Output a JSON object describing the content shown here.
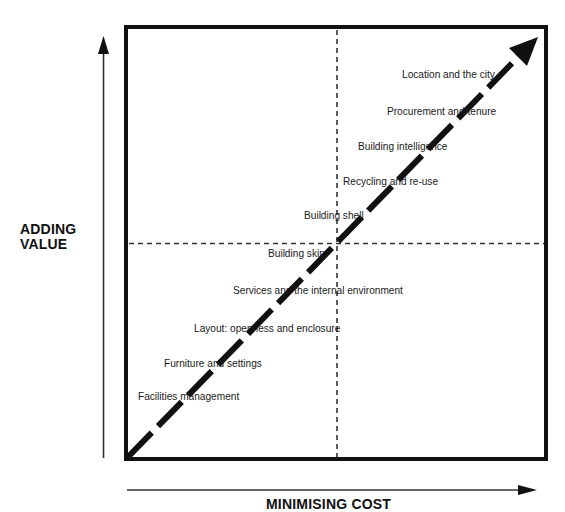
{
  "diagram": {
    "y_axis_label": [
      "ADDING",
      "VALUE"
    ],
    "x_axis_label": "MINIMISING COST",
    "colors": {
      "line": "#111111",
      "background": "#ffffff",
      "axis_arrow": "#333333"
    },
    "labels": [
      {
        "text": "Location and the city",
        "x": 402,
        "y": 68
      },
      {
        "text": "Procurement and tenure",
        "x": 387,
        "y": 105
      },
      {
        "text": "Building intelligence",
        "x": 358,
        "y": 140
      },
      {
        "text": "Recycling and re-use",
        "x": 343,
        "y": 175
      },
      {
        "text": "Building shell",
        "x": 304,
        "y": 209
      },
      {
        "text": "Building skin",
        "x": 268,
        "y": 247
      },
      {
        "text": "Services and the internal environment",
        "x": 233,
        "y": 284
      },
      {
        "text": "Layout: openness and enclosure",
        "x": 194,
        "y": 322
      },
      {
        "text": "Furniture and settings",
        "x": 164,
        "y": 357
      },
      {
        "text": "Facilities management",
        "x": 138,
        "y": 390
      }
    ]
  }
}
